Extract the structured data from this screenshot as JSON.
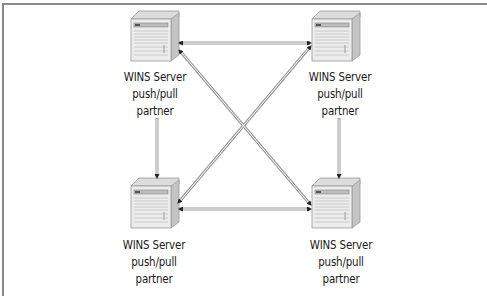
{
  "figure": {
    "caption_clipped": "Figure: WINS replication push/pull partners",
    "colors": {
      "border": "#8a8a8a",
      "arrow": "#9a9a9a",
      "server_face": "#e6e6e6",
      "server_side": "#c4c4c4",
      "text": "#1a1a1a"
    }
  },
  "nodes": [
    {
      "id": "top-left",
      "line1": "WINS Server",
      "line2": "push/pull",
      "line3": "partner"
    },
    {
      "id": "top-right",
      "line1": "WINS Server",
      "line2": "push/pull",
      "line3": "partner"
    },
    {
      "id": "bottom-left",
      "line1": "WINS Server",
      "line2": "push/pull",
      "line3": "partner"
    },
    {
      "id": "bottom-right",
      "line1": "WINS Server",
      "line2": "push/pull",
      "line3": "partner"
    }
  ],
  "edges": [
    {
      "from": "top-left",
      "to": "top-right",
      "type": "bidirectional"
    },
    {
      "from": "bottom-left",
      "to": "bottom-right",
      "type": "bidirectional"
    },
    {
      "from": "top-left",
      "to": "bottom-right",
      "type": "bidirectional"
    },
    {
      "from": "top-right",
      "to": "bottom-left",
      "type": "bidirectional"
    },
    {
      "from": "top-left",
      "to": "bottom-left",
      "type": "directional"
    },
    {
      "from": "top-right",
      "to": "bottom-right",
      "type": "directional"
    }
  ]
}
